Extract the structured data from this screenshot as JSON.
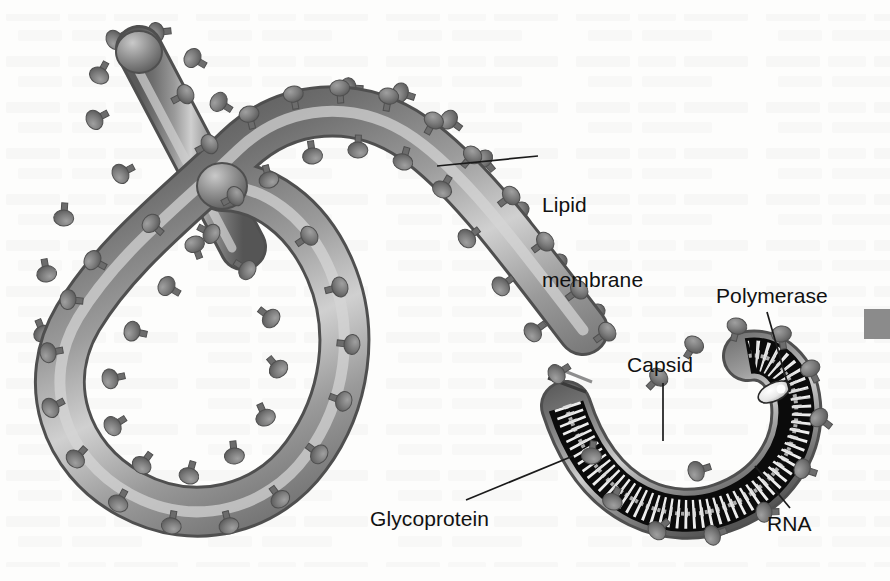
{
  "figure": {
    "background_color": "#fdfdfc",
    "ink_color": "#111111"
  },
  "labels": {
    "lipid_membrane": "Lipid\nmembrane",
    "lipid_membrane_line1": "Lipid",
    "lipid_membrane_line2": "membrane",
    "polymerase": "Polymerase",
    "capsid": "Capsid",
    "glycoprotein": "Glycoprotein",
    "rna": "RNA"
  },
  "leaders": [
    {
      "name": "lipid-membrane-leader",
      "x1": 538,
      "y1": 156,
      "x2": 437,
      "y2": 166
    },
    {
      "name": "polymerase-leader",
      "x1": 767,
      "y1": 312,
      "x2": 790,
      "y2": 392
    },
    {
      "name": "capsid-leader",
      "x1": 663,
      "y1": 383,
      "x2": 663,
      "y2": 441
    },
    {
      "name": "glycoprotein-leader",
      "x1": 466,
      "y1": 500,
      "x2": 573,
      "y2": 456
    },
    {
      "name": "rna-leader",
      "x1": 790,
      "y1": 508,
      "x2": 755,
      "y2": 466
    }
  ],
  "palette": {
    "membrane_outline": "#4e4e4e",
    "membrane_dark": "#6f6f6f",
    "membrane_mid": "#8e8e8e",
    "membrane_light": "#b9b9b9",
    "membrane_highlight": "#d2d2d2",
    "spike": "#7b7b7b",
    "spike_dark": "#5f5f5f",
    "capsid_black": "#0b0b0b",
    "rna_white": "#ededed",
    "polymerase_fill": "#f2f2f2",
    "edge_marker": "#8b8b8b"
  },
  "structures": [
    {
      "name": "filament-tube",
      "role": "enveloped filamentous nucleocapsid body"
    },
    {
      "name": "hook-loop",
      "role": "curled shepherd's-crook end of the filament"
    },
    {
      "name": "branch-arm",
      "role": "short upper-left filament arm with domed cap"
    },
    {
      "name": "cutaway-head",
      "role": "sectioned hook end revealing interior"
    },
    {
      "name": "capsid-shell",
      "role": "dark helical nucleocapsid shell"
    },
    {
      "name": "rna-helix",
      "role": "zigzag single-stranded RNA genome"
    },
    {
      "name": "polymerase-body",
      "role": "light oval polymerase complex at tip"
    },
    {
      "name": "glycoprotein-spikes",
      "role": "mushroom-shaped surface projections"
    }
  ],
  "counts": {
    "glycoprotein_spikes": 86
  },
  "edge_marker": {
    "name": "page-edge-swatch",
    "color": "#8b8b8b"
  }
}
